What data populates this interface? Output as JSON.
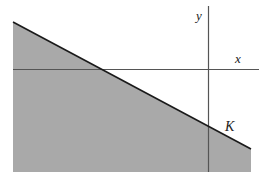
{
  "diagram": {
    "labels": {
      "x_axis": "x",
      "y_axis": "y",
      "region": "K"
    },
    "colors": {
      "background": "#ffffff",
      "region_fill": "#a9a9a9",
      "boundary_line": "#1a1a1a",
      "axis_line": "#555555",
      "label": "#222222"
    }
  }
}
